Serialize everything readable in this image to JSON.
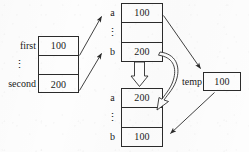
{
  "figure": {
    "background_color": "#fdfdfd",
    "ink_color": "#2b2b2b",
    "width": 249,
    "height": 152
  },
  "tables": {
    "locals": {
      "name": "caller-locals",
      "labels": [
        "first",
        "⋮",
        "second"
      ],
      "values": [
        "100",
        "",
        "200"
      ]
    },
    "frame_top": {
      "name": "callee-frame-before",
      "labels": [
        "a",
        "⋮",
        "b"
      ],
      "values": [
        "100",
        "",
        "200"
      ]
    },
    "frame_bottom": {
      "name": "callee-frame-after",
      "labels": [
        "a",
        "⋮",
        "b"
      ],
      "values": [
        "200",
        "",
        "100"
      ]
    },
    "temp": {
      "label": "temp",
      "value": "100"
    }
  },
  "arrows": [
    {
      "name": "first-to-a",
      "from": "locals.first",
      "to": "frame_top.a",
      "style": "thin-solid"
    },
    {
      "name": "second-to-b",
      "from": "locals.second",
      "to": "frame_top.b",
      "style": "thin-solid"
    },
    {
      "name": "a-to-temp",
      "from": "frame_top.a",
      "to": "temp",
      "style": "thin-solid"
    },
    {
      "name": "b-to-a-copy",
      "from": "frame_top.b",
      "to": "frame_bottom.a",
      "style": "block-outline"
    },
    {
      "name": "b-ribbon-copy",
      "from": "frame_top.b",
      "to": "frame_bottom.a",
      "style": "curved-ribbon"
    },
    {
      "name": "temp-to-b",
      "from": "temp",
      "to": "frame_bottom.b",
      "style": "thin-solid"
    }
  ]
}
